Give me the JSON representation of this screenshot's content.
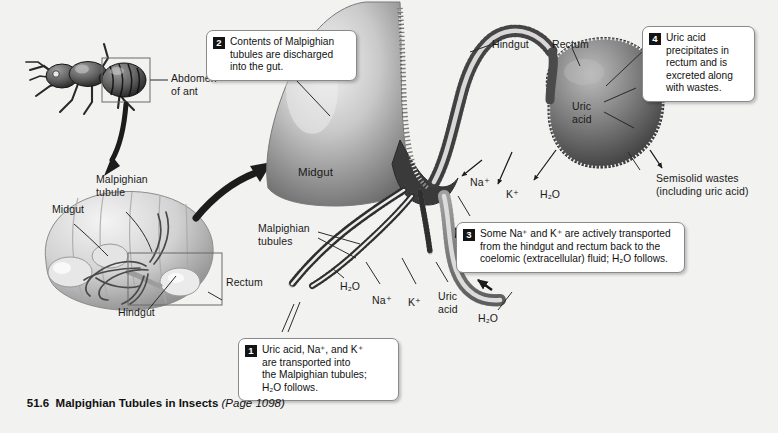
{
  "figure": {
    "number": "51.6",
    "title": "Malpighian Tubules in Insects",
    "page_ref": "(Page 1098)"
  },
  "callouts": [
    {
      "id": "1",
      "number": "1",
      "text": "Uric acid, Na+, and K+\nare transported into\nthe Malpighian tubules;\nH2O follows."
    },
    {
      "id": "2",
      "number": "2",
      "text": "Contents of Malpighian\ntubules are discharged\ninto the gut."
    },
    {
      "id": "3",
      "number": "3",
      "text": "Some Na+ and K+ are actively transported\nfrom the hindgut and rectum back to the\ncoelomic (extracellular) fluid; H2O follows."
    },
    {
      "id": "4",
      "number": "4",
      "text": "Uric acid\nprecipitates in\nrectum and is\nexcreted along\nwith wastes."
    }
  ],
  "ant_panel": {
    "abdomen_label": "Abdomen\nof ant"
  },
  "abdomen_panel": {
    "malpighian_tubule": "Malpighian\ntubule",
    "midgut": "Midgut",
    "rectum": "Rectum",
    "hindgut": "Hindgut"
  },
  "main_diagram": {
    "midgut": "Midgut",
    "malpighian_tubules": "Malpighian\ntubules",
    "hindgut": "Hindgut",
    "rectum": "Rectum",
    "uric_acid_in_rectum": "Uric\nacid",
    "semisolid_wastes": "Semisolid wastes\n(including uric acid)",
    "ions": {
      "na_upper": "Na+",
      "k_upper": "K+",
      "h2o_upper": "H2O",
      "h2o_lower_left": "H2O",
      "na_lower": "Na+",
      "k_lower": "K+",
      "uric_acid_lower": "Uric\nacid",
      "h2o_lower_right": "H2O"
    }
  },
  "colors": {
    "background": "#f2f2f0",
    "callout_bg": "#ffffff",
    "callout_border": "#8a8a8a",
    "number_badge": "#141414",
    "text": "#1a1a1a",
    "line": "#2b2b2b"
  }
}
